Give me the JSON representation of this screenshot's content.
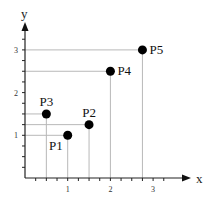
{
  "chart_data": {
    "type": "scatter",
    "title": "",
    "xlabel": "x",
    "ylabel": "y",
    "xlim": [
      0,
      3.5
    ],
    "ylim": [
      0,
      3.5
    ],
    "x_ticks": [
      1,
      2,
      3
    ],
    "y_ticks": [
      1,
      2,
      3
    ],
    "x_tick_labels": [
      "1",
      "2",
      "3"
    ],
    "y_tick_labels": [
      "1",
      "2",
      "3"
    ],
    "minor_tick_step": 0.25,
    "grid": false,
    "projection_lines": true,
    "legend": "none",
    "points": [
      {
        "label": "P1",
        "x": 1.0,
        "y": 1.0,
        "label_pos": "bottom-left"
      },
      {
        "label": "P2",
        "x": 1.5,
        "y": 1.25,
        "label_pos": "top"
      },
      {
        "label": "P3",
        "x": 0.5,
        "y": 1.5,
        "label_pos": "top"
      },
      {
        "label": "P4",
        "x": 2.0,
        "y": 2.5,
        "label_pos": "right"
      },
      {
        "label": "P5",
        "x": 2.75,
        "y": 3.0,
        "label_pos": "right"
      }
    ],
    "colors": {
      "point": "#000000",
      "guide": "#b8b8b8",
      "axis": "#222222"
    }
  }
}
